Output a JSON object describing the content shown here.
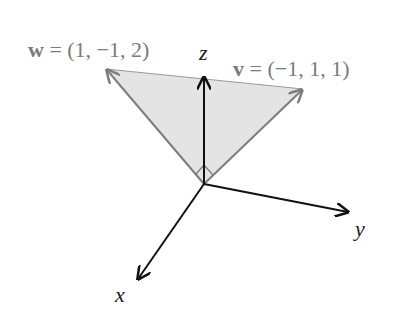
{
  "diagram": {
    "vectors": [
      {
        "name": "w",
        "components": "(1, −1, 2)",
        "label": "w = (1, −1, 2)",
        "color": "#7a7a7a"
      },
      {
        "name": "v",
        "components": "(−1, 1, 1)",
        "label": "v = (−1, 1, 1)",
        "color": "#7a7a7a"
      }
    ],
    "axes": {
      "x": "x",
      "y": "y",
      "z": "z"
    },
    "labels": {
      "w_symbol": "w",
      "w_rest": " = (1, −1, 2)",
      "v_symbol": "v",
      "v_rest": " = (−1, 1, 1)"
    },
    "colors": {
      "axis": "#111111",
      "vector": "#7d7d7d",
      "triangle_fill": "#e4e4e4",
      "background": "#ffffff"
    },
    "features": {
      "shaded_triangle": true,
      "right_angle_marker": true
    }
  }
}
